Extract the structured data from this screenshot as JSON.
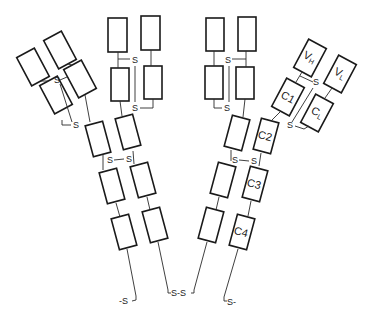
{
  "diagram": {
    "title": "",
    "disulfide_label": "S",
    "labels": {
      "vh": "V",
      "vh_sub": "H",
      "vl": "V",
      "vl_sub": "L",
      "c1": "C1",
      "cl": "C",
      "cl_sub": "L",
      "c2": "C2",
      "c3": "C3",
      "c4": "C4"
    },
    "tail_labels": {
      "left": "-S",
      "center": "S-S",
      "right": "S-"
    }
  }
}
